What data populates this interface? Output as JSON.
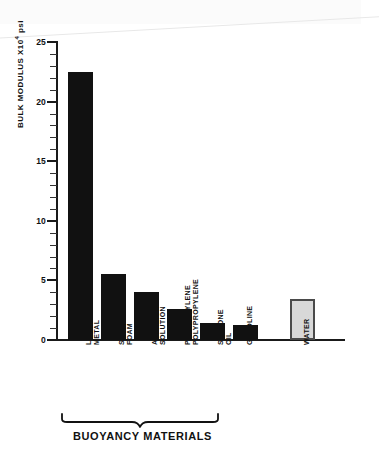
{
  "chart_data": {
    "type": "bar",
    "title": "",
    "xlabel": "",
    "ylabel": "BULK MODULUS X10",
    "ylabel_exponent": "4",
    "ylabel_units": "psi",
    "ylim": [
      0,
      25
    ],
    "grid": false,
    "legend": "none",
    "y_major_ticks": [
      0,
      5,
      10,
      15,
      20,
      25
    ],
    "y_tick_labels": [
      "0",
      "5",
      "10",
      "15",
      "20",
      "25"
    ],
    "y_minor_tick_step": 1,
    "categories": [
      "LITHIUM METAL",
      "SYNTACTIC FOAM",
      "AMMONIA SOLUTION",
      "POLYETHYLENE POLYPROPYLENE",
      "SILICONE OIL",
      "GASOLINE",
      "WATER"
    ],
    "category_lines": [
      [
        "LITHIUM",
        "METAL"
      ],
      [
        "SYNTACTIC",
        "FOAM"
      ],
      [
        "AMMONIA",
        "SOLUTION"
      ],
      [
        "POLYETHYLENE",
        "POLYPROPYLENE"
      ],
      [
        "SILICONE",
        "OIL"
      ],
      [
        "GASOLINE"
      ],
      [
        "WATER"
      ]
    ],
    "values": [
      22.5,
      5.5,
      4.0,
      2.6,
      1.4,
      1.3,
      3.4
    ],
    "bar_styles": [
      "filled",
      "filled",
      "filled",
      "filled",
      "filled",
      "filled",
      "outlined"
    ],
    "colors": {
      "bar_fill": "#111111",
      "bar_fill_reference": "#d8d8d8",
      "bar_stroke_reference": "#4a4a4a",
      "axis": "#1a1a1a",
      "text": "#111111",
      "background": "#ffffff"
    }
  },
  "annotations": {
    "group_caption": "BUOYANCY MATERIALS",
    "group_span_categories": [
      "LITHIUM METAL",
      "SYNTACTIC FOAM",
      "AMMONIA SOLUTION",
      "POLYETHYLENE POLYPROPYLENE",
      "SILICONE OIL",
      "GASOLINE"
    ]
  }
}
